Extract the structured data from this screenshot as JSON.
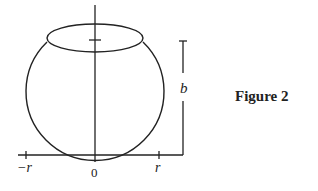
{
  "figure": {
    "caption": "Figure 2",
    "axis": {
      "tick_labels": [
        "−r",
        "0",
        "r"
      ]
    },
    "dimension": {
      "label": "b"
    },
    "colors": {
      "stroke": "#222222",
      "background": "#ffffff"
    }
  }
}
